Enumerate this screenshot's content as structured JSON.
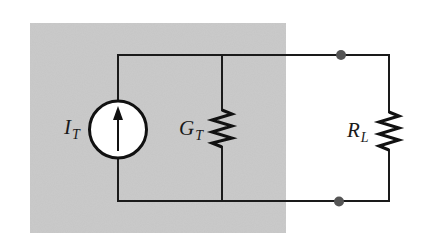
{
  "figure": {
    "type": "circuit-schematic",
    "colors": {
      "background": "#ffffff",
      "shaded_region": "#c8c8c8",
      "wire": "#1a1a1a",
      "terminal_dot": "#555555",
      "source_fill": "#ffffff"
    }
  },
  "components": {
    "current_source": {
      "symbol": "I",
      "subscript": "T",
      "kind": "current-source",
      "arrow_direction": "up"
    },
    "conductance": {
      "symbol": "G",
      "subscript": "T",
      "kind": "resistor"
    },
    "load": {
      "symbol": "R",
      "subscript": "L",
      "kind": "resistor"
    }
  },
  "terminals": [
    {
      "id": "top-terminal",
      "kind": "node-dot"
    },
    {
      "id": "bottom-terminal",
      "kind": "node-dot"
    }
  ]
}
